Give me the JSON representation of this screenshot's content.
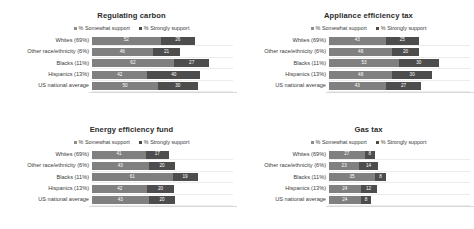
{
  "chart_data": [
    {
      "type": "bar",
      "title": "Regulating carbon",
      "xlabel": "",
      "ylabel": "",
      "grid": false,
      "legend_position": "top",
      "stacked": true,
      "orientation": "horizontal",
      "xlim": [
        0,
        100
      ],
      "categories": [
        "Whites (69%)",
        "Other race/ethnicity (6%)",
        "Blacks (11%)",
        "Hispanics (13%)",
        "US national average"
      ],
      "series": [
        {
          "name": "% Somewhat support",
          "color": "#808080",
          "values": [
            52,
            46,
            62,
            42,
            50
          ]
        },
        {
          "name": "% Strongly support",
          "color": "#4d4d4d",
          "values": [
            26,
            21,
            27,
            40,
            30
          ]
        }
      ]
    },
    {
      "type": "bar",
      "title": "Appliance efficiency tax",
      "xlabel": "",
      "ylabel": "",
      "grid": false,
      "legend_position": "top",
      "stacked": true,
      "orientation": "horizontal",
      "xlim": [
        0,
        100
      ],
      "categories": [
        "Whites (69%)",
        "Other race/ethnicity (6%)",
        "Blacks (11%)",
        "Hispanics (13%)",
        "US national average"
      ],
      "series": [
        {
          "name": "% Somewhat support",
          "color": "#808080",
          "values": [
            43,
            48,
            53,
            48,
            43
          ]
        },
        {
          "name": "% Strongly support",
          "color": "#4d4d4d",
          "values": [
            25,
            20,
            30,
            30,
            27
          ]
        }
      ]
    },
    {
      "type": "bar",
      "title": "Energy efficiency fund",
      "xlabel": "",
      "ylabel": "",
      "grid": false,
      "legend_position": "top",
      "stacked": true,
      "orientation": "horizontal",
      "xlim": [
        0,
        100
      ],
      "categories": [
        "Whites (69%)",
        "Other race/ethnicity (6%)",
        "Blacks (11%)",
        "Hispanics (13%)",
        "US national average"
      ],
      "series": [
        {
          "name": "% Somewhat support",
          "color": "#808080",
          "values": [
            41,
            43,
            61,
            42,
            43
          ]
        },
        {
          "name": "% Strongly support",
          "color": "#4d4d4d",
          "values": [
            17,
            20,
            19,
            20,
            20
          ]
        }
      ]
    },
    {
      "type": "bar",
      "title": "Gas tax",
      "xlabel": "",
      "ylabel": "",
      "grid": false,
      "legend_position": "top",
      "stacked": true,
      "orientation": "horizontal",
      "xlim": [
        0,
        100
      ],
      "categories": [
        "Whites (69%)",
        "Other race/ethnicity (6%)",
        "Blacks (11%)",
        "Hispanics (13%)",
        "US national average"
      ],
      "series": [
        {
          "name": "% Somewhat support",
          "color": "#808080",
          "values": [
            27,
            23,
            35,
            24,
            24
          ]
        },
        {
          "name": "% Strongly support",
          "color": "#4d4d4d",
          "values": [
            8,
            14,
            8,
            12,
            8
          ]
        }
      ]
    }
  ],
  "legend": {
    "somewhat_label": "% Somewhat support",
    "strongly_label": "% Strongly support"
  }
}
